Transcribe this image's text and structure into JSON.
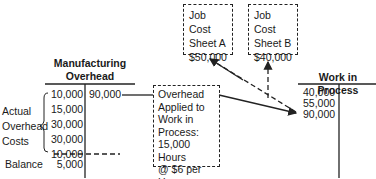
{
  "job_sheets": [
    {
      "line1": "Job Cost",
      "line2": "Sheet A",
      "amount": "$50,000"
    },
    {
      "line1": "Job Cost",
      "line2": "Sheet B",
      "amount": "$40,000"
    }
  ],
  "manufacturing_overhead": {
    "title_line1": "Manufacturing",
    "title_line2": "Overhead",
    "debits": [
      "10,000",
      "15,000",
      "30,000",
      "30,000",
      "10,000"
    ],
    "credit": "90,000",
    "balance_label": "Balance",
    "balance": "5,000",
    "bracket_label": [
      "Actual",
      "Overhead",
      "Costs"
    ]
  },
  "applied_box": {
    "lines": [
      "Overhead",
      "Applied to",
      "Work in",
      "Process:",
      "15,000 Hours",
      "@ $6 per Hour"
    ]
  },
  "work_in_process": {
    "title": "Work in Process",
    "debits": [
      "40,000",
      "55,000",
      "90,000"
    ]
  }
}
